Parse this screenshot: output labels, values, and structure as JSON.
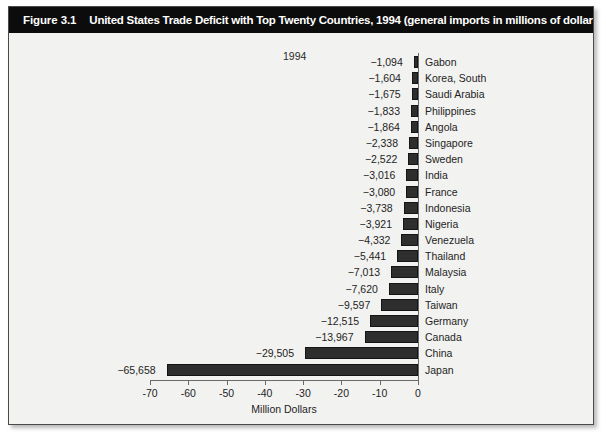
{
  "figure": {
    "number": "Figure 3.1",
    "title": "United States Trade Deficit with Top Twenty Countries, 1994 (general imports in millions of dollars)"
  },
  "chart_data": {
    "type": "bar",
    "orientation": "horizontal",
    "title": "United States Trade Deficit with Top Twenty Countries, 1994 (general imports in millions of dollars)",
    "series_label": "1994",
    "legend_position": "top-center",
    "grid": false,
    "xlabel": "Million Dollars",
    "ylabel": "",
    "xlim": [
      -70,
      0
    ],
    "xticks": [
      -70,
      -60,
      -50,
      -40,
      -30,
      -20,
      -10,
      0
    ],
    "xticklabels": [
      "-70",
      "-60",
      "-50",
      "-40",
      "-30",
      "-20",
      "-10",
      "0"
    ],
    "units": "millions of dollars",
    "categories": [
      "Gabon",
      "Korea, South",
      "Saudi Arabia",
      "Philippines",
      "Angola",
      "Singapore",
      "Sweden",
      "India",
      "France",
      "Indonesia",
      "Nigeria",
      "Venezuela",
      "Thailand",
      "Malaysia",
      "Italy",
      "Taiwan",
      "Germany",
      "Canada",
      "China",
      "Japan"
    ],
    "values": [
      -1094,
      -1604,
      -1675,
      -1833,
      -1864,
      -2338,
      -2522,
      -3016,
      -3080,
      -3738,
      -3921,
      -4332,
      -5441,
      -7013,
      -7620,
      -9597,
      -12515,
      -13967,
      -29505,
      -65658
    ],
    "value_labels": [
      "−1,094",
      "−1,604",
      "−1,675",
      "−1,833",
      "−1,864",
      "−2,338",
      "−2,522",
      "−3,016",
      "−3,080",
      "−3,738",
      "−3,921",
      "−4,332",
      "−5,441",
      "−7,013",
      "−7,620",
      "−9,597",
      "−12,515",
      "−13,967",
      "−29,505",
      "−65,658"
    ],
    "bar_color": "#2e2e2e",
    "background_color": "#f2f2f0",
    "header_color": "#0c0c0c"
  }
}
